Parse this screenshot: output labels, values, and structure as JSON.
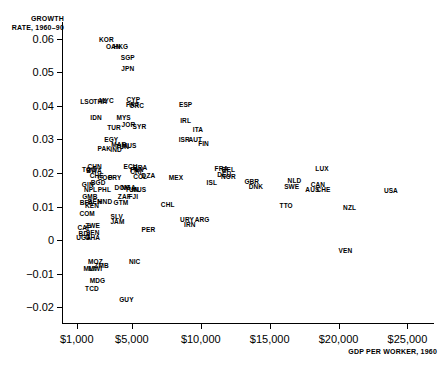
{
  "chart_data": {
    "type": "scatter",
    "title": "",
    "ylabel": "GROWTH RATE, 1960–90",
    "xlabel": "GDP PER WORKER, 1960",
    "xlim": [
      0,
      27000
    ],
    "ylim": [
      -0.025,
      0.065
    ],
    "grid": false,
    "legend": "none",
    "xticks": [
      {
        "value": 1000,
        "label": "$1,000"
      },
      {
        "value": 5000,
        "label": "$5,000"
      },
      {
        "value": 10000,
        "label": "$10,000"
      },
      {
        "value": 15000,
        "label": "$15,000"
      },
      {
        "value": 20000,
        "label": "$20,000"
      },
      {
        "value": 25000,
        "label": "$25,000"
      }
    ],
    "yticks": [
      {
        "value": 0.06,
        "label": "0.06"
      },
      {
        "value": 0.05,
        "label": "0.05"
      },
      {
        "value": 0.04,
        "label": "0.04"
      },
      {
        "value": 0.03,
        "label": "0.03"
      },
      {
        "value": 0.02,
        "label": "0.02"
      },
      {
        "value": 0.01,
        "label": "0.01"
      },
      {
        "value": 0.0,
        "label": "0"
      },
      {
        "value": -0.01,
        "label": "−0.01"
      },
      {
        "value": -0.02,
        "label": "−0.02"
      }
    ],
    "point_label_type": "country-iso3",
    "points": [
      {
        "label": "KOR",
        "x": 3150,
        "y": 0.06
      },
      {
        "label": "OAN",
        "x": 3650,
        "y": 0.0578
      },
      {
        "label": "HKG",
        "x": 4200,
        "y": 0.0578
      },
      {
        "label": "SGP",
        "x": 4700,
        "y": 0.0545
      },
      {
        "label": "JPN",
        "x": 4700,
        "y": 0.0512
      },
      {
        "label": "LSO",
        "x": 1750,
        "y": 0.0415
      },
      {
        "label": "THA",
        "x": 2700,
        "y": 0.0415
      },
      {
        "label": "MYC",
        "x": 3150,
        "y": 0.0418
      },
      {
        "label": "CYP",
        "x": 5100,
        "y": 0.042
      },
      {
        "label": "PRT",
        "x": 5050,
        "y": 0.0405
      },
      {
        "label": "GRC",
        "x": 5350,
        "y": 0.0403
      },
      {
        "label": "ESP",
        "x": 8900,
        "y": 0.0405
      },
      {
        "label": "IDN",
        "x": 2400,
        "y": 0.0368
      },
      {
        "label": "MYS",
        "x": 4400,
        "y": 0.0368
      },
      {
        "label": "IRL",
        "x": 8900,
        "y": 0.0358
      },
      {
        "label": "TUR",
        "x": 3700,
        "y": 0.0338
      },
      {
        "label": "JOR",
        "x": 4750,
        "y": 0.0345
      },
      {
        "label": "SYR",
        "x": 5550,
        "y": 0.034
      },
      {
        "label": "ITA",
        "x": 9800,
        "y": 0.0332
      },
      {
        "label": "EGY",
        "x": 3500,
        "y": 0.03
      },
      {
        "label": "ISR",
        "x": 8800,
        "y": 0.03
      },
      {
        "label": "AUT",
        "x": 9600,
        "y": 0.03
      },
      {
        "label": "FIN",
        "x": 10200,
        "y": 0.0288
      },
      {
        "label": "PAK",
        "x": 3000,
        "y": 0.0275
      },
      {
        "label": "MAR",
        "x": 4050,
        "y": 0.0285
      },
      {
        "label": "TUN",
        "x": 4300,
        "y": 0.028
      },
      {
        "label": "MUS",
        "x": 4800,
        "y": 0.0282
      },
      {
        "label": "IND",
        "x": 3850,
        "y": 0.0272
      },
      {
        "label": "CHN",
        "x": 2300,
        "y": 0.0222
      },
      {
        "label": "TGO",
        "x": 1900,
        "y": 0.0212
      },
      {
        "label": "BWA",
        "x": 2250,
        "y": 0.0208
      },
      {
        "label": "ECU",
        "x": 4900,
        "y": 0.0222
      },
      {
        "label": "BRA",
        "x": 5600,
        "y": 0.0218
      },
      {
        "label": "PAN",
        "x": 5350,
        "y": 0.0212
      },
      {
        "label": "CRI",
        "x": 5300,
        "y": 0.0205
      },
      {
        "label": "FRA",
        "x": 11500,
        "y": 0.0215
      },
      {
        "label": "BEL",
        "x": 12000,
        "y": 0.0212
      },
      {
        "label": "DEU",
        "x": 11700,
        "y": 0.0198
      },
      {
        "label": "NOR",
        "x": 12000,
        "y": 0.0192
      },
      {
        "label": "LUX",
        "x": 18800,
        "y": 0.0215
      },
      {
        "label": "CHE",
        "x": 2450,
        "y": 0.0195
      },
      {
        "label": "COG",
        "x": 3050,
        "y": 0.0188
      },
      {
        "label": "PRY",
        "x": 3750,
        "y": 0.0188
      },
      {
        "label": "COL",
        "x": 5600,
        "y": 0.0192
      },
      {
        "label": "DZA",
        "x": 6200,
        "y": 0.0195
      },
      {
        "label": "MEX",
        "x": 8200,
        "y": 0.0188
      },
      {
        "label": "ISL",
        "x": 10800,
        "y": 0.0172
      },
      {
        "label": "GBR",
        "x": 13700,
        "y": 0.0175
      },
      {
        "label": "NLD",
        "x": 16800,
        "y": 0.018
      },
      {
        "label": "DNK",
        "x": 14000,
        "y": 0.0162
      },
      {
        "label": "SWE",
        "x": 16600,
        "y": 0.0162
      },
      {
        "label": "CAN",
        "x": 18500,
        "y": 0.0168
      },
      {
        "label": "AUS",
        "x": 18100,
        "y": 0.0152
      },
      {
        "label": "CHE",
        "x": 18900,
        "y": 0.0152
      },
      {
        "label": "USA",
        "x": 23800,
        "y": 0.0148
      },
      {
        "label": "GIN",
        "x": 1800,
        "y": 0.0168
      },
      {
        "label": "BGD",
        "x": 2550,
        "y": 0.0172
      },
      {
        "label": "NPL",
        "x": 2000,
        "y": 0.0152
      },
      {
        "label": "PHL",
        "x": 3000,
        "y": 0.0152
      },
      {
        "label": "DOM",
        "x": 4300,
        "y": 0.0158
      },
      {
        "label": "NGA",
        "x": 4750,
        "y": 0.0158
      },
      {
        "label": "TUN",
        "x": 5000,
        "y": 0.0152
      },
      {
        "label": "MUS",
        "x": 5500,
        "y": 0.0152
      },
      {
        "label": "ZAF",
        "x": 4450,
        "y": 0.0132
      },
      {
        "label": "FJI",
        "x": 5100,
        "y": 0.0132
      },
      {
        "label": "GMB",
        "x": 1950,
        "y": 0.013
      },
      {
        "label": "BFA",
        "x": 1700,
        "y": 0.0115
      },
      {
        "label": "BEN",
        "x": 2300,
        "y": 0.0118
      },
      {
        "label": "HND",
        "x": 3050,
        "y": 0.0118
      },
      {
        "label": "KEN",
        "x": 2100,
        "y": 0.0105
      },
      {
        "label": "GTM",
        "x": 4200,
        "y": 0.0115
      },
      {
        "label": "CHL",
        "x": 7600,
        "y": 0.0108
      },
      {
        "label": "TTO",
        "x": 16200,
        "y": 0.0105
      },
      {
        "label": "NZL",
        "x": 20800,
        "y": 0.0098
      },
      {
        "label": "COM",
        "x": 1750,
        "y": 0.0082
      },
      {
        "label": "SLV",
        "x": 3900,
        "y": 0.0072
      },
      {
        "label": "JAM",
        "x": 3950,
        "y": 0.0058
      },
      {
        "label": "URY",
        "x": 9000,
        "y": 0.0062
      },
      {
        "label": "ARG",
        "x": 10100,
        "y": 0.0062
      },
      {
        "label": "IRN",
        "x": 9200,
        "y": 0.0048
      },
      {
        "label": "CAF",
        "x": 1550,
        "y": 0.004
      },
      {
        "label": "ZWE",
        "x": 2150,
        "y": 0.0045
      },
      {
        "label": "BDI",
        "x": 1550,
        "y": 0.0022
      },
      {
        "label": "SEN",
        "x": 2150,
        "y": 0.0025
      },
      {
        "label": "UGA",
        "x": 1500,
        "y": 0.001
      },
      {
        "label": "GHA",
        "x": 2150,
        "y": 0.0008
      },
      {
        "label": "PER",
        "x": 6200,
        "y": 0.0032
      },
      {
        "label": "VEN",
        "x": 20500,
        "y": -0.0028
      },
      {
        "label": "MOZ",
        "x": 2350,
        "y": -0.0062
      },
      {
        "label": "ZMB",
        "x": 2800,
        "y": -0.0075
      },
      {
        "label": "MLI",
        "x": 1900,
        "y": -0.0082
      },
      {
        "label": "MWI",
        "x": 2350,
        "y": -0.0082
      },
      {
        "label": "NIC",
        "x": 5200,
        "y": -0.0062
      },
      {
        "label": "MDG",
        "x": 2500,
        "y": -0.0118
      },
      {
        "label": "TCD",
        "x": 2100,
        "y": -0.0142
      },
      {
        "label": "GUY",
        "x": 4600,
        "y": -0.0175
      }
    ]
  }
}
